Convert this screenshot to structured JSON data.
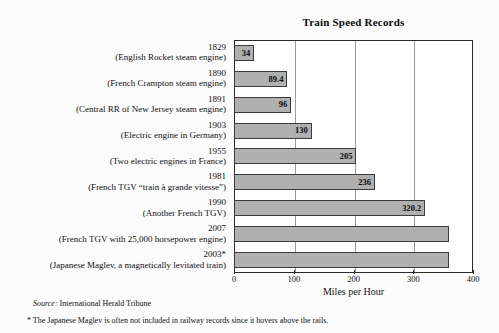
{
  "chart_data": {
    "type": "bar",
    "orientation": "horizontal",
    "title": "Train Speed Records",
    "xlabel": "Miles per Hour",
    "ylabel": "",
    "xlim": [
      0,
      400
    ],
    "xticks": [
      0,
      100,
      200,
      300,
      400
    ],
    "grid": true,
    "legend": null,
    "categories": [
      "1829 (English Rocket steam engine)",
      "1890 (French Crampton steam engine)",
      "1891 (Central RR of New Jersey steam engine)",
      "1903 (Electric engine in Germany)",
      "1955 (Two electric engines in France)",
      "1981 (French TGV “train à grande vitesse”)",
      "1990 (Another French TGV)",
      "2007 (French TGV with 25,000 horsepower engine)",
      "2003* (Japanese Maglev, a magnetically levitated train)"
    ],
    "values": [
      34,
      89.4,
      96,
      130,
      205,
      236,
      320.2,
      360,
      360
    ],
    "value_labels": [
      "34",
      "89.4",
      "96",
      "130",
      "205",
      "236",
      "320.2",
      "",
      ""
    ],
    "rows": [
      {
        "year": "1829",
        "desc": "(English Rocket steam engine)",
        "value": 34,
        "label": "34"
      },
      {
        "year": "1890",
        "desc": "(French Crampton steam engine)",
        "value": 89.4,
        "label": "89.4"
      },
      {
        "year": "1891",
        "desc": "(Central RR of New Jersey steam engine)",
        "value": 96,
        "label": "96"
      },
      {
        "year": "1903",
        "desc": "(Electric engine in Germany)",
        "value": 130,
        "label": "130"
      },
      {
        "year": "1955",
        "desc": "(Two electric engines in France)",
        "value": 205,
        "label": "205"
      },
      {
        "year": "1981",
        "desc": "(French TGV “train à grande vitesse”)",
        "value": 236,
        "label": "236"
      },
      {
        "year": "1990",
        "desc": "(Another French TGV)",
        "value": 320.2,
        "label": "320.2"
      },
      {
        "year": "2007",
        "desc": "(French TGV with 25,000 horsepower engine)",
        "value": 360,
        "label": ""
      },
      {
        "year": "2003*",
        "desc": "(Japanese Maglev, a magnetically levitated train)",
        "value": 360,
        "label": ""
      }
    ]
  },
  "source": {
    "label": "Source:",
    "text": " International Herald Tribune"
  },
  "footnote": {
    "text": "* The Japanese Maglev is often not included in railway records since it hovers above the rails."
  },
  "colors": {
    "bar_fill": "#b0b0b0",
    "bar_border": "#3b3b3b",
    "plot_border": "#2b2b2b",
    "gridline": "#9a9a9a",
    "text": "#111111",
    "background": "#fbfbfb"
  }
}
